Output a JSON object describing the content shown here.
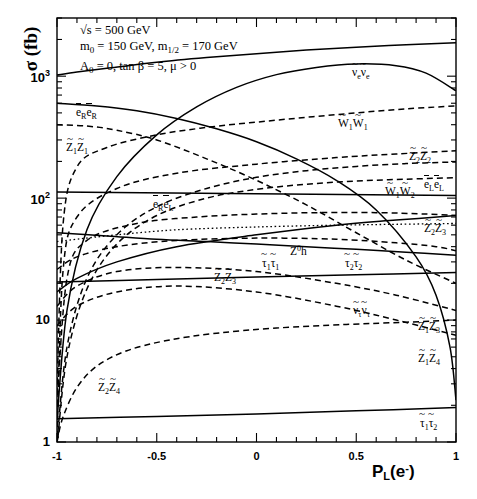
{
  "figure": {
    "ylabel": "σ (fb)",
    "xlabel_base": "P",
    "xlabel_sub": "L",
    "xlabel_arg": "(e",
    "xlabel_sup": "-",
    "xlabel_close": ")",
    "params": [
      "√s = 500 GeV",
      "m₀ = 150 GeV,  m₁⁄₂ = 170 GeV",
      "A₀ = 0,  tan β = 5, μ > 0"
    ],
    "param_lines": {
      "line1_pre": "√s = 500 GeV",
      "line2_a": "m",
      "line2_a_sub": "0",
      "line2_b": " = 150 GeV,  m",
      "line2_b_sub": "1/2",
      "line2_c": " = 170 GeV",
      "line3_a": "A",
      "line3_a_sub": "0",
      "line3_b": " = 0,  tan β = 5, μ > 0"
    }
  },
  "axes": {
    "x_ticks": [
      "-1",
      "-0.5",
      "0",
      "0.5",
      "1"
    ],
    "x_tick_values": [
      -1,
      -0.5,
      0,
      0.5,
      1
    ],
    "y_ticks": [
      "1",
      "10",
      "10",
      "10"
    ],
    "y_tick_exp": [
      "",
      "",
      "2",
      "3"
    ],
    "y_tick_values": [
      1,
      10,
      100,
      1000
    ]
  },
  "chart_data": {
    "type": "line",
    "title": "",
    "subtitle": "",
    "xlabel": "P_L(e-)",
    "ylabel": "sigma (fb)",
    "xlim": [
      -1,
      1
    ],
    "ylim": [
      1,
      3000
    ],
    "yscale": "log",
    "xscale": "linear",
    "grid": false,
    "legend": "inline-curve-labels",
    "annotations": [
      "sqrt(s) = 500 GeV",
      "m_0 = 150 GeV, m_1/2 = 170 GeV",
      "A_0 = 0, tan beta = 5, mu > 0"
    ],
    "series": [
      {
        "name": "snu_e snu_e",
        "label_html": "ν̃<sub>e</sub>ν̃<sub>e</sub>",
        "style": "solid",
        "x": [
          -1,
          -0.9,
          -0.75,
          -0.5,
          -0.25,
          0,
          0.25,
          0.5,
          0.75,
          1
        ],
        "y": [
          1020,
          1080,
          1160,
          1300,
          1420,
          1530,
          1640,
          1730,
          1810,
          1880
        ]
      },
      {
        "name": "seR seR",
        "label_html": "ẽ<sub>R</sub>ẽ<sub>R</sub>",
        "style": "solid",
        "x": [
          -1,
          -0.8,
          -0.6,
          -0.4,
          -0.2,
          0,
          0.2,
          0.4,
          0.6,
          0.8,
          0.9,
          0.97,
          1
        ],
        "y": [
          600,
          570,
          520,
          450,
          370,
          290,
          210,
          140,
          80,
          33,
          16,
          6,
          2.2
        ]
      },
      {
        "name": "chargino1 chargino1",
        "label_html": "W̃<sub>1</sub>W̃<sub>1</sub>",
        "style": "dashed",
        "x": [
          -1,
          -0.97,
          -0.9,
          -0.75,
          -0.5,
          -0.25,
          0,
          0.25,
          0.5,
          0.75,
          1
        ],
        "y": [
          2.5,
          60,
          180,
          260,
          330,
          380,
          420,
          460,
          500,
          540,
          570
        ]
      },
      {
        "name": "neutralino1 neutralino1",
        "label_html": "Z̃<sub>1</sub>Z̃<sub>1</sub>",
        "style": "dashed",
        "x": [
          -1,
          -0.85,
          -0.7,
          -0.5,
          -0.25,
          0,
          0.25,
          0.5,
          0.75,
          1
        ],
        "y": [
          400,
          390,
          360,
          300,
          210,
          140,
          88,
          52,
          31,
          20
        ]
      },
      {
        "name": "neutralino2 neutralino2",
        "label_html": "Z̃<sub>2</sub>Z̃<sub>2</sub>",
        "style": "dashed",
        "x": [
          -1,
          -0.97,
          -0.9,
          -0.7,
          -0.4,
          0,
          0.4,
          0.7,
          1
        ],
        "y": [
          1.1,
          25,
          70,
          120,
          160,
          190,
          215,
          230,
          245
        ]
      },
      {
        "name": "seR seL",
        "label_html": "ẽ<sub>R</sub>ẽ<sub>L</sub>",
        "style": "solid",
        "x": [
          -1,
          -0.95,
          -0.85,
          -0.7,
          -0.5,
          -0.3,
          -0.1,
          0.1,
          0.3,
          0.5,
          0.7,
          0.85,
          1
        ],
        "y": [
          1.5,
          12,
          55,
          150,
          330,
          560,
          810,
          1030,
          1180,
          1260,
          1220,
          1060,
          760
        ]
      },
      {
        "name": "seL seL",
        "label_html": "ẽ<sub>L</sub>ẽ<sub>L</sub>",
        "style": "dashed",
        "x": [
          -1,
          -0.95,
          -0.85,
          -0.7,
          -0.5,
          -0.25,
          0,
          0.25,
          0.5,
          0.75,
          1
        ],
        "y": [
          1.0,
          6,
          22,
          50,
          85,
          120,
          148,
          168,
          182,
          192,
          198
        ]
      },
      {
        "name": "chargino1 chargino2",
        "label_html": "W̃<sub>1</sub>W̃<sub>2</sub>",
        "style": "dashed",
        "x": [
          -1,
          -0.95,
          -0.85,
          -0.7,
          -0.5,
          -0.25,
          0,
          0.25,
          0.5,
          0.75,
          1
        ],
        "y": [
          0.9,
          5,
          18,
          42,
          72,
          100,
          118,
          130,
          138,
          143,
          147
        ]
      },
      {
        "name": "flat-line-100",
        "label_html": "",
        "style": "solid",
        "x": [
          -1,
          1
        ],
        "y": [
          112,
          105
        ]
      },
      {
        "name": "neutralino2 neutralino3",
        "label_html": "Z̃<sub>2</sub>Z̃<sub>3</sub>",
        "style": "dashed",
        "x": [
          -1,
          -0.95,
          -0.85,
          -0.6,
          -0.3,
          0,
          0.3,
          0.6,
          0.85,
          1
        ],
        "y": [
          2,
          22,
          45,
          62,
          70,
          74,
          76,
          76,
          74,
          72
        ]
      },
      {
        "name": "Z0 h",
        "label_html": "Z<sup>0</sup>h",
        "style": "dotted",
        "x": [
          -1,
          -0.9,
          -0.7,
          -0.4,
          0,
          0.4,
          0.7,
          1
        ],
        "y": [
          44,
          46,
          50,
          55,
          58,
          60,
          61,
          62
        ]
      },
      {
        "name": "stau1 stau1",
        "label_html": "τ̃<sub>1</sub>τ̃<sub>1</sub>",
        "style": "solid",
        "x": [
          -1,
          -0.75,
          -0.5,
          -0.25,
          0,
          0.25,
          0.5,
          0.75,
          1
        ],
        "y": [
          52,
          49,
          46,
          44,
          42,
          40,
          38,
          36,
          34
        ]
      },
      {
        "name": "stau2 stau2",
        "label_html": "τ̃<sub>2</sub>τ̃<sub>2</sub>",
        "style": "dashed",
        "x": [
          -1,
          -0.9,
          -0.7,
          -0.4,
          0,
          0.4,
          0.7,
          0.9,
          1
        ],
        "y": [
          26,
          33,
          40,
          45,
          47,
          46,
          43,
          40,
          37
        ]
      },
      {
        "name": "neutralino3 neutralino3 band",
        "label_html": "Z̃<sub>3</sub>Z̃<sub>3</sub>",
        "style": "solid",
        "x": [
          -1,
          -0.9,
          -0.7,
          -0.4,
          0,
          0.4,
          0.7,
          1
        ],
        "y": [
          17,
          22,
          30,
          40,
          50,
          60,
          66,
          72
        ]
      },
      {
        "name": "snu_tau snu_tau",
        "label_html": "ν̃<sub>τ</sub>ν̃<sub>τ</sub>",
        "style": "solid",
        "x": [
          -1,
          -0.5,
          0,
          0.5,
          1
        ],
        "y": [
          20.5,
          21.5,
          22.5,
          23.5,
          24.5
        ]
      },
      {
        "name": "neutralino1 neutralino3",
        "label_html": "Z̃<sub>1</sub>Z̃<sub>3</sub>",
        "style": "dashed",
        "x": [
          -1,
          -0.9,
          -0.7,
          -0.4,
          0,
          0.4,
          0.7,
          1
        ],
        "y": [
          13,
          19,
          25,
          27,
          25,
          20,
          16,
          12
        ]
      },
      {
        "name": "neutralino1 neutralino4",
        "label_html": "Z̃<sub>1</sub>Z̃<sub>4</sub>",
        "style": "dashed",
        "x": [
          -1,
          -0.9,
          -0.7,
          -0.4,
          0,
          0.4,
          0.7,
          1
        ],
        "y": [
          9,
          13,
          17,
          19,
          17,
          13,
          10,
          7.5
        ]
      },
      {
        "name": "neutralino2 neutralino4",
        "label_html": "Z̃<sub>2</sub>Z̃<sub>4</sub>",
        "style": "dashed",
        "x": [
          -1,
          -0.97,
          -0.9,
          -0.8,
          -0.65,
          -0.45,
          -0.2,
          0.1,
          0.45,
          0.75,
          1
        ],
        "y": [
          1.0,
          1.6,
          2.8,
          4.2,
          5.6,
          6.8,
          7.8,
          8.6,
          9.2,
          9.6,
          10.0
        ]
      },
      {
        "name": "stau1 stau2",
        "label_html": "τ̃<sub>1</sub>τ̃<sub>2</sub>",
        "style": "solid",
        "x": [
          -1,
          -0.5,
          0,
          0.5,
          1
        ],
        "y": [
          1.55,
          1.62,
          1.7,
          1.8,
          1.92
        ]
      }
    ]
  },
  "curve_labels": [
    {
      "id": "lab-snue",
      "text": "ν̃_e ν̃_e",
      "x": 352,
      "y": 66
    },
    {
      "id": "lab-serer",
      "text": "ẽ_R ẽ_R",
      "x": 76,
      "y": 106
    },
    {
      "id": "lab-z1z1",
      "text": "Z̃_1 Z̃_1",
      "x": 66,
      "y": 141
    },
    {
      "id": "lab-w1w1",
      "text": "W̃_1 W̃_1",
      "x": 338,
      "y": 117
    },
    {
      "id": "lab-z2z2",
      "text": "Z̃_2 Z̃_2",
      "x": 409,
      "y": 150
    },
    {
      "id": "lab-serel",
      "text": "ẽ_R ẽ_L",
      "x": 153,
      "y": 198
    },
    {
      "id": "lab-w1w2",
      "text": "W̃_1 W̃_2",
      "x": 385,
      "y": 185
    },
    {
      "id": "lab-elel",
      "text": "ẽ_L ẽ_L",
      "x": 424,
      "y": 178
    },
    {
      "id": "lab-z2z3",
      "text": "Z̃_2 Z̃_3",
      "x": 424,
      "y": 222
    },
    {
      "id": "lab-z0h",
      "text": "Z⁰h",
      "x": 290,
      "y": 244
    },
    {
      "id": "lab-t1t1",
      "text": "τ̃_1 τ̃_1",
      "x": 262,
      "y": 257
    },
    {
      "id": "lab-t2t2",
      "text": "τ̃_2 τ̃_2",
      "x": 345,
      "y": 257
    },
    {
      "id": "lab-z3z3",
      "text": "Z̃_2 Z̃_3",
      "x": 214,
      "y": 271
    },
    {
      "id": "lab-snutau",
      "text": "ν̃_τ ν̃_τ",
      "x": 353,
      "y": 304
    },
    {
      "id": "lab-z1z3",
      "text": "Z̃_1 Z̃_3",
      "x": 418,
      "y": 320
    },
    {
      "id": "lab-z1z4",
      "text": "Z̃_1 Z̃_4",
      "x": 418,
      "y": 352
    },
    {
      "id": "lab-z2z4",
      "text": "Z̃_2 Z̃_4",
      "x": 98,
      "y": 381
    },
    {
      "id": "lab-t1t2",
      "text": "τ̃_1 τ̃_2",
      "x": 420,
      "y": 417
    }
  ],
  "colors": {
    "line": "#000000",
    "background": "#ffffff",
    "text": "#000000"
  }
}
